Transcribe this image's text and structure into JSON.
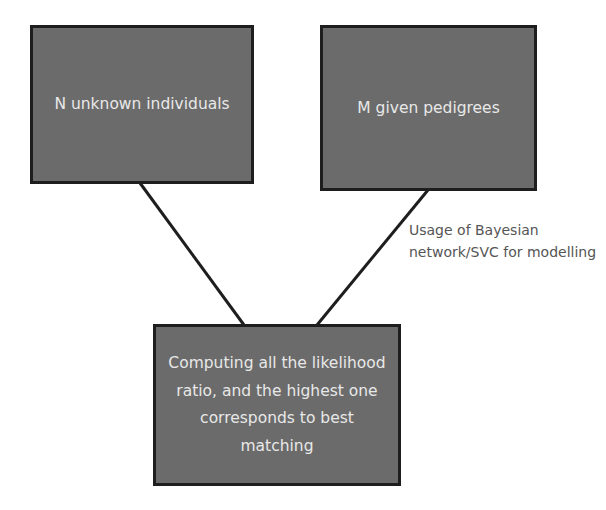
{
  "diagram": {
    "nodes": [
      {
        "id": "n",
        "label": "N unknown individuals"
      },
      {
        "id": "m",
        "label": "M given pedigrees"
      },
      {
        "id": "c",
        "label": "Computing all the likelihood ratio, and the highest one corresponds to best matching"
      }
    ],
    "edges": [
      {
        "from": "n",
        "to": "c",
        "label": ""
      },
      {
        "from": "m",
        "to": "c",
        "label": "Usage of Bayesian network/SVC for modelling"
      }
    ],
    "annotation": "Usage of  Bayesian network/SVC for modelling",
    "colors": {
      "box_fill": "#6b6b6b",
      "box_border": "#1e1e1e",
      "box_text": "#e8e8e8",
      "annotation_text": "#555555",
      "line": "#1e1e1e"
    }
  }
}
